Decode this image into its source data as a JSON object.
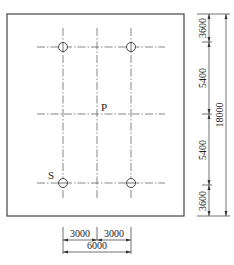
{
  "drawing": {
    "title": "",
    "point_labels": {
      "center": "P",
      "support": "S"
    },
    "vertical_dimensions": {
      "segments": [
        "3600",
        "5400",
        "5400",
        "3600"
      ],
      "total": "18000"
    },
    "horizontal_dimensions": {
      "segments": [
        "3000",
        "3000"
      ],
      "total": "6000"
    },
    "holes_count": 4,
    "colors": {
      "line": "#444444",
      "background": "#ffffff"
    }
  }
}
